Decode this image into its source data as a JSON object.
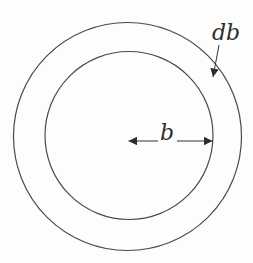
{
  "figure": {
    "background_color": "#fdfdfd",
    "line_color": "#4a4a4a",
    "arrow_color": "#333333",
    "text_color": "#2d2d2d",
    "labels": {
      "radius": "b",
      "ring_thickness": "db"
    }
  }
}
